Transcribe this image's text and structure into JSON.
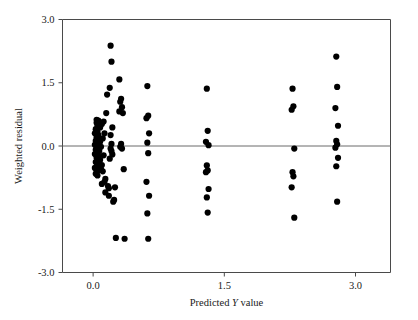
{
  "chart_data": {
    "type": "scatter",
    "title": "",
    "xlabel": "Predicted Y value",
    "xlabel_parts": {
      "pre": "Predicted ",
      "italic": "Y",
      "post": " value"
    },
    "ylabel": "Weighted residual",
    "xlim": [
      -0.35,
      3.4
    ],
    "ylim": [
      -3.0,
      3.0
    ],
    "xticks": [
      0.0,
      1.5,
      3.0
    ],
    "xticklabels": [
      "0.0",
      "1.5",
      "3.0"
    ],
    "yticks": [
      -3.0,
      -1.5,
      0.0,
      1.5,
      3.0
    ],
    "yticklabels": [
      "-3.0",
      "-1.5",
      "0.0",
      "1.5",
      "3.0"
    ],
    "grid": false,
    "legend": null,
    "reference_line": {
      "orientation": "horizontal",
      "value": 0.0,
      "color": "#6b6b6b"
    },
    "marker": {
      "shape": "circle",
      "color": "#000000",
      "size_px": 4.1
    },
    "point_color": "#000000",
    "axis_color": "#4a4a4a",
    "background": "#ffffff",
    "n_points": 104,
    "points": [
      [
        0.04,
        0.62
      ],
      [
        0.04,
        0.55
      ],
      [
        0.05,
        0.48
      ],
      [
        0.06,
        0.6
      ],
      [
        0.07,
        0.52
      ],
      [
        0.03,
        0.4
      ],
      [
        0.05,
        0.34
      ],
      [
        0.08,
        0.44
      ],
      [
        0.02,
        0.3
      ],
      [
        0.06,
        0.26
      ],
      [
        0.04,
        0.2
      ],
      [
        0.07,
        0.16
      ],
      [
        0.03,
        0.12
      ],
      [
        0.05,
        0.07
      ],
      [
        0.08,
        0.1
      ],
      [
        0.02,
        0.03
      ],
      [
        0.06,
        0.0
      ],
      [
        0.04,
        -0.04
      ],
      [
        0.09,
        -0.02
      ],
      [
        0.03,
        -0.09
      ],
      [
        0.05,
        -0.14
      ],
      [
        0.07,
        -0.12
      ],
      [
        0.02,
        -0.19
      ],
      [
        0.06,
        -0.24
      ],
      [
        0.04,
        -0.28
      ],
      [
        0.08,
        -0.33
      ],
      [
        0.03,
        -0.38
      ],
      [
        0.05,
        -0.44
      ],
      [
        0.07,
        -0.47
      ],
      [
        0.02,
        -0.52
      ],
      [
        0.06,
        -0.57
      ],
      [
        0.04,
        -0.62
      ],
      [
        0.09,
        -0.55
      ],
      [
        0.03,
        -0.66
      ],
      [
        0.05,
        -0.7
      ],
      [
        0.11,
        -0.6
      ],
      [
        0.1,
        -0.45
      ],
      [
        0.12,
        -0.22
      ],
      [
        0.11,
        0.18
      ],
      [
        0.13,
        0.3
      ],
      [
        0.1,
        0.52
      ],
      [
        0.12,
        0.58
      ],
      [
        0.14,
        -0.78
      ],
      [
        0.13,
        -0.85
      ],
      [
        0.1,
        -0.9
      ],
      [
        0.16,
        1.22
      ],
      [
        0.15,
        0.78
      ],
      [
        0.17,
        -0.95
      ],
      [
        0.14,
        -1.1
      ],
      [
        0.18,
        -1.18
      ],
      [
        0.2,
        2.38
      ],
      [
        0.21,
        2.0
      ],
      [
        0.19,
        1.38
      ],
      [
        0.22,
        0.44
      ],
      [
        0.2,
        0.26
      ],
      [
        0.21,
        -0.12
      ],
      [
        0.19,
        -0.3
      ],
      [
        0.22,
        -0.2
      ],
      [
        0.2,
        -0.06
      ],
      [
        0.21,
        0.05
      ],
      [
        0.18,
        -1.0
      ],
      [
        0.23,
        -1.32
      ],
      [
        0.25,
        -0.98
      ],
      [
        0.24,
        -1.28
      ],
      [
        0.26,
        -2.18
      ],
      [
        0.3,
        1.58
      ],
      [
        0.32,
        1.12
      ],
      [
        0.31,
        1.05
      ],
      [
        0.33,
        0.92
      ],
      [
        0.3,
        0.82
      ],
      [
        0.34,
        0.78
      ],
      [
        0.32,
        0.05
      ],
      [
        0.31,
        -0.02
      ],
      [
        0.33,
        -0.06
      ],
      [
        0.35,
        -0.55
      ],
      [
        0.36,
        -2.2
      ],
      [
        0.62,
        1.42
      ],
      [
        0.63,
        0.72
      ],
      [
        0.61,
        0.66
      ],
      [
        0.64,
        0.3
      ],
      [
        0.62,
        0.08
      ],
      [
        0.63,
        -0.17
      ],
      [
        0.61,
        -0.85
      ],
      [
        0.64,
        -1.18
      ],
      [
        0.62,
        -1.6
      ],
      [
        0.63,
        -2.2
      ],
      [
        1.3,
        1.36
      ],
      [
        1.31,
        0.36
      ],
      [
        1.29,
        0.1
      ],
      [
        1.32,
        0.02
      ],
      [
        1.3,
        -0.46
      ],
      [
        1.31,
        -0.58
      ],
      [
        1.29,
        -0.62
      ],
      [
        1.32,
        -1.02
      ],
      [
        1.3,
        -1.22
      ],
      [
        1.31,
        -1.58
      ],
      [
        2.28,
        1.36
      ],
      [
        2.29,
        0.94
      ],
      [
        2.27,
        0.86
      ],
      [
        2.3,
        -0.06
      ],
      [
        2.28,
        -0.62
      ],
      [
        2.29,
        -0.72
      ],
      [
        2.27,
        -0.98
      ],
      [
        2.3,
        -1.7
      ],
      [
        2.78,
        2.12
      ],
      [
        2.79,
        1.4
      ],
      [
        2.77,
        0.9
      ],
      [
        2.8,
        0.48
      ],
      [
        2.78,
        0.12
      ],
      [
        2.79,
        0.04
      ],
      [
        2.77,
        -0.04
      ],
      [
        2.8,
        -0.28
      ],
      [
        2.78,
        -0.48
      ],
      [
        2.79,
        -1.32
      ]
    ]
  }
}
